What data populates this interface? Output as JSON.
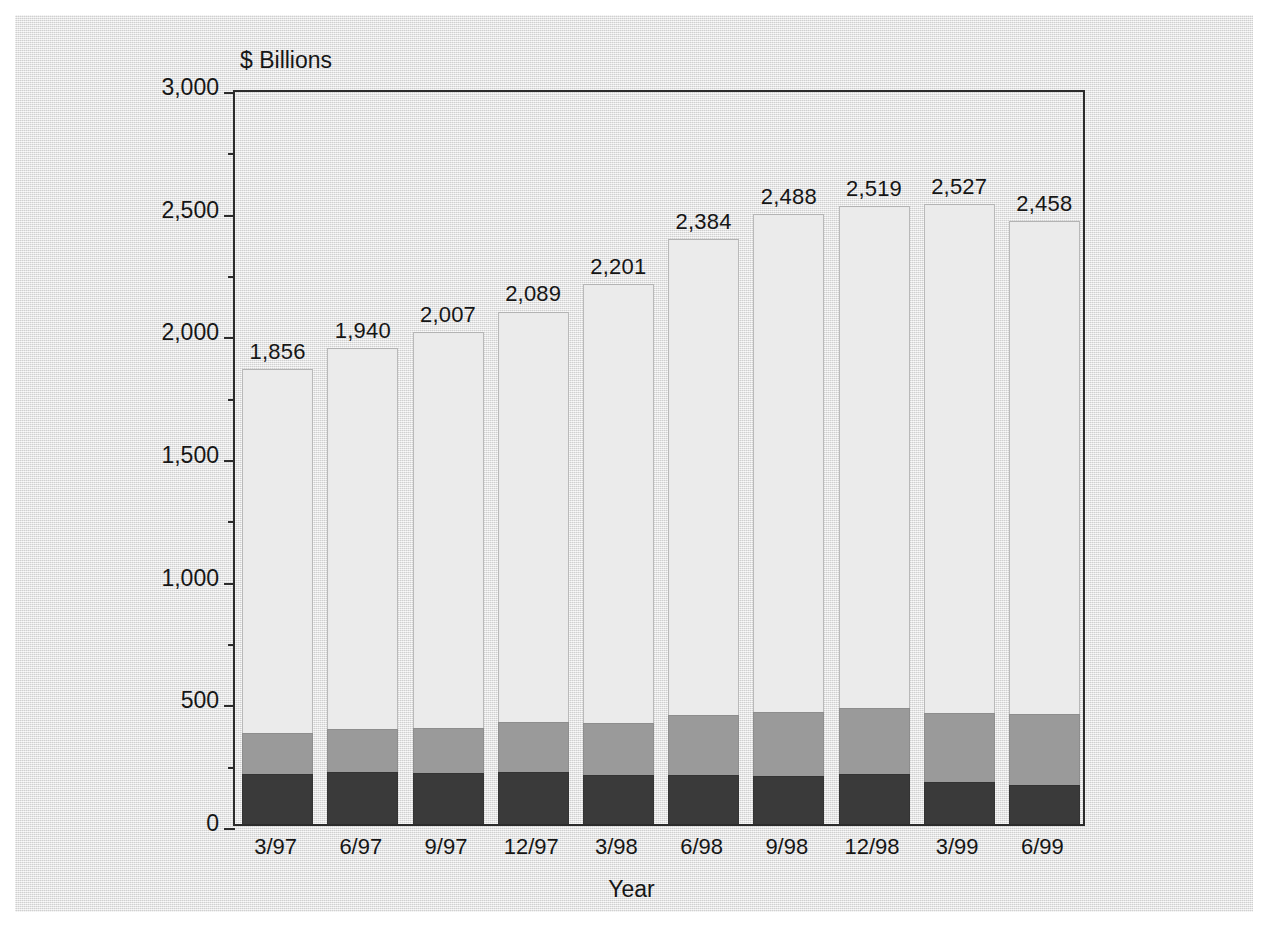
{
  "chart_data": {
    "type": "bar",
    "subtype": "stacked-bar",
    "title": "",
    "xlabel": "Year",
    "ylabel": "$ Billions",
    "ylim": [
      0,
      3000
    ],
    "yticks": [
      0,
      500,
      1000,
      1500,
      2000,
      2500,
      3000
    ],
    "ytick_labels": [
      "0",
      "500",
      "1,000",
      "1,500",
      "2,000",
      "2,500",
      "3,000"
    ],
    "minor_tick_interval": 250,
    "grid": false,
    "legend": "none",
    "categories": [
      "3/97",
      "6/97",
      "9/97",
      "12/97",
      "3/98",
      "6/98",
      "9/98",
      "12/98",
      "3/99",
      "6/99"
    ],
    "totals": [
      1856,
      1940,
      2007,
      2089,
      2201,
      2384,
      2488,
      2519,
      2527,
      2458
    ],
    "total_labels": [
      "1,856",
      "1,940",
      "2,007",
      "2,089",
      "2,201",
      "2,384",
      "2,488",
      "2,519",
      "2,527",
      "2,458"
    ],
    "series": [
      {
        "name": "bottom-segment",
        "color": "#3a3a3a",
        "values": [
          205,
          210,
          208,
          212,
          198,
          200,
          196,
          203,
          172,
          160
        ]
      },
      {
        "name": "middle-segment",
        "color": "#9a9a9a",
        "values": [
          168,
          178,
          182,
          205,
          215,
          245,
          260,
          268,
          282,
          290
        ]
      },
      {
        "name": "top-segment",
        "color": "#ebebeb",
        "values": [
          1483,
          1552,
          1617,
          1672,
          1788,
          1939,
          2032,
          2048,
          2073,
          2008
        ]
      }
    ]
  },
  "colors": {
    "page_background": "#ffffff",
    "paper_background": "#e6e6e6",
    "axis": "#2b2b2b",
    "text": "#161616",
    "segment_bottom": "#3a3a3a",
    "segment_middle": "#9a9a9a",
    "segment_top": "#ebebeb"
  }
}
